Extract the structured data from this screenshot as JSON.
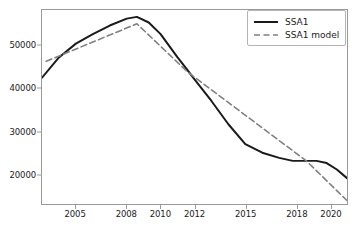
{
  "chart_data": {
    "type": "line",
    "title": "",
    "xlabel": "",
    "ylabel": "",
    "grid": false,
    "legend_position": "upper right",
    "xlim": [
      2003.0,
      2021.0
    ],
    "ylim": [
      13200,
      58200
    ],
    "yticks": [
      20000,
      30000,
      40000,
      50000
    ],
    "ytick_labels": [
      "20000",
      "30000",
      "40000",
      "50000"
    ],
    "xticks": [
      2005,
      2008,
      2010,
      2012,
      2015,
      2018,
      2020
    ],
    "xtick_labels": [
      "2005",
      "2008",
      "2010",
      "2012",
      "2015",
      "2018",
      "2020"
    ],
    "series": [
      {
        "name": "SSA1",
        "style": "solid",
        "color": "#1a1a1a",
        "linewidth": 2.0,
        "x": [
          2003.0,
          2004.0,
          2005.0,
          2006.0,
          2007.0,
          2008.0,
          2008.6,
          2009.3,
          2010.0,
          2011.0,
          2011.6,
          2012.0,
          2013.0,
          2014.0,
          2015.0,
          2016.0,
          2017.0,
          2017.8,
          2018.6,
          2019.2,
          2019.8,
          2020.4,
          2021.0
        ],
        "values": [
          42500,
          47200,
          50400,
          52600,
          54600,
          56200,
          56600,
          55300,
          52600,
          47200,
          44200,
          42100,
          37100,
          31700,
          27100,
          25100,
          23900,
          23200,
          23200,
          23200,
          22700,
          21200,
          19200
        ]
      },
      {
        "name": "SSA1 model",
        "style": "dashed",
        "color": "#808080",
        "linewidth": 1.6,
        "x": [
          2003.25,
          2008.6,
          2011.6,
          2018.6,
          2021.0
        ],
        "values": [
          46300,
          55000,
          43800,
          23200,
          14000
        ]
      }
    ],
    "annotations": []
  },
  "legend": {
    "entries": [
      {
        "label": "SSA1"
      },
      {
        "label": "SSA1 model"
      }
    ]
  }
}
